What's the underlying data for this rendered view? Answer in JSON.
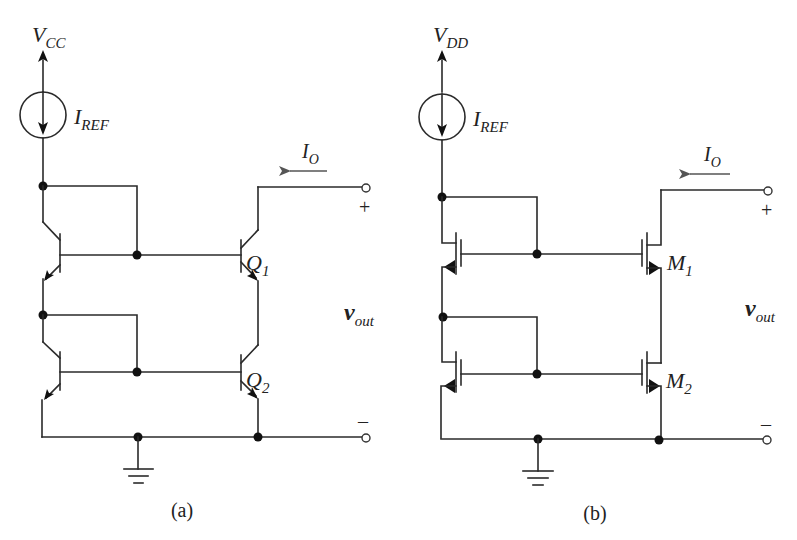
{
  "figure": {
    "panels": [
      {
        "id": "a",
        "caption": "(a)",
        "supply": {
          "main": "V",
          "sub": "CC"
        },
        "reference_current": {
          "main": "I",
          "sub": "REF"
        },
        "output_current": {
          "main": "I",
          "sub": "O"
        },
        "output_voltage": {
          "main": "v",
          "sub": "out"
        },
        "plus": "+",
        "minus": "–",
        "devices": [
          {
            "main": "Q",
            "sub": "1",
            "type": "npn-bjt"
          },
          {
            "main": "Q",
            "sub": "2",
            "type": "npn-bjt"
          }
        ]
      },
      {
        "id": "b",
        "caption": "(b)",
        "supply": {
          "main": "V",
          "sub": "DD"
        },
        "reference_current": {
          "main": "I",
          "sub": "REF"
        },
        "output_current": {
          "main": "I",
          "sub": "O"
        },
        "output_voltage": {
          "main": "v",
          "sub": "out"
        },
        "plus": "+",
        "minus": "–",
        "devices": [
          {
            "main": "M",
            "sub": "1",
            "type": "nmos"
          },
          {
            "main": "M",
            "sub": "2",
            "type": "nmos"
          }
        ]
      }
    ]
  }
}
